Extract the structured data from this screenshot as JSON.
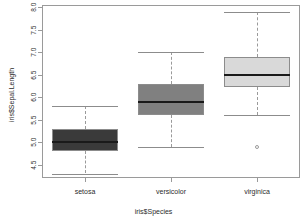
{
  "chart_data": {
    "type": "box",
    "title": "",
    "xlabel": "iris$Species",
    "ylabel": "iris$Sepal.Length",
    "categories": [
      "setosa",
      "versicolor",
      "virginica"
    ],
    "ylim": [
      4.2,
      8.05
    ],
    "yticks": [
      8.0,
      7.5,
      7.0,
      6.5,
      6.0,
      5.5,
      5.0,
      4.5
    ],
    "ytick_labels": [
      "8.0",
      "7.5",
      "7.0",
      "6.5",
      "6.0",
      "5.5",
      "5.0",
      "4.5"
    ],
    "grid": false,
    "legend": "none",
    "boxes": [
      {
        "name": "setosa",
        "fill": "#3a3a3a",
        "whisker_low": 4.3,
        "q1": 4.8,
        "median": 5.0,
        "q3": 5.3,
        "whisker_high": 5.8,
        "outliers": []
      },
      {
        "name": "versicolor",
        "fill": "#808080",
        "whisker_low": 4.9,
        "q1": 5.6,
        "median": 5.9,
        "q3": 6.3,
        "whisker_high": 7.0,
        "outliers": []
      },
      {
        "name": "virginica",
        "fill": "#d9d9d9",
        "whisker_low": 5.6,
        "q1": 6.225,
        "median": 6.5,
        "q3": 6.9,
        "whisker_high": 7.9,
        "outliers": [
          4.9
        ]
      }
    ]
  },
  "colors": {
    "frame": "#9a9a9a",
    "median": "#1a1a1a",
    "whisker": "#9a9a9a",
    "text": "#2b2b2b",
    "background": "#ffffff"
  }
}
